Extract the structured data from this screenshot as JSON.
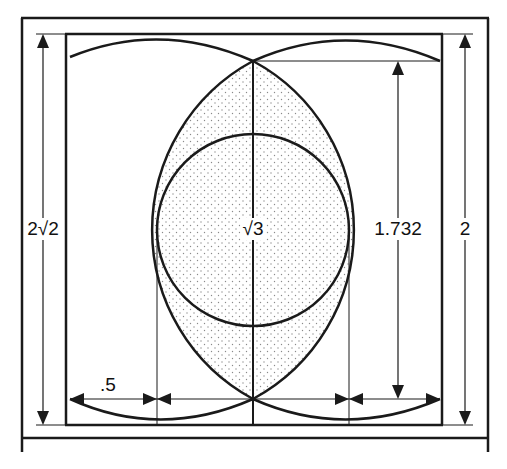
{
  "diagram": {
    "labels": {
      "left_height": "2√2",
      "center": "√3",
      "right_inner_height": "1.732",
      "right_outer_height": "2",
      "bottom_half": ".5"
    },
    "colors": {
      "stroke": "#1a1a1a",
      "background": "#ffffff",
      "stipple": "#8a8a8a"
    }
  }
}
